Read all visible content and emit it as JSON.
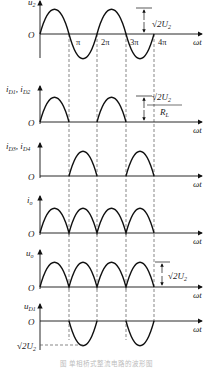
{
  "figure": {
    "caption": "图  单相桥式整流电路的波形图",
    "x_axis_label": "ωt",
    "origin_label": "O",
    "tick_labels": [
      "π",
      "2π",
      "3π",
      "4π"
    ],
    "panels": [
      {
        "id": "u2",
        "ylabel": "u",
        "ylabel_sub": "2",
        "waveform": "sine",
        "annotation": "√2U",
        "annotation_sub": "2"
      },
      {
        "id": "iD1D2",
        "ylabel": "i",
        "ylabel_sub": "D1",
        "ylabel2": ", i",
        "ylabel2_sub": "D2",
        "waveform": "half-wave positive (0–π, 2π–3π)",
        "annotation_num": "√2U",
        "annotation_num_sub": "2",
        "annotation_den": "R",
        "annotation_den_sub": "L"
      },
      {
        "id": "iD3D4",
        "ylabel": "i",
        "ylabel_sub": "D3",
        "ylabel2": ", i",
        "ylabel2_sub": "D4",
        "waveform": "half-wave positive (π–2π, 3π–4π)"
      },
      {
        "id": "io",
        "ylabel": "i",
        "ylabel_sub": "o",
        "waveform": "full-wave rectified"
      },
      {
        "id": "uo",
        "ylabel": "u",
        "ylabel_sub": "o",
        "waveform": "full-wave rectified",
        "annotation": "√2U",
        "annotation_sub": "2"
      },
      {
        "id": "uD1",
        "ylabel": "u",
        "ylabel_sub": "D1",
        "waveform": "negative humps (π–2π, 3π–4π)",
        "annotation": "√2U",
        "annotation_sub": "2"
      }
    ]
  }
}
